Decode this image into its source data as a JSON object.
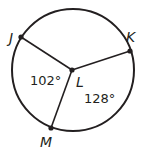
{
  "diagram": {
    "type": "circle-with-central-angles",
    "colors": {
      "stroke": "#231f20",
      "background": "#ffffff"
    },
    "circle": {
      "cx": 73,
      "cy": 70,
      "r": 61
    },
    "center": {
      "label": "L",
      "x": 72,
      "y": 70
    },
    "points": [
      {
        "label": "J",
        "x": 21,
        "y": 37
      },
      {
        "label": "K",
        "x": 130,
        "y": 51
      },
      {
        "label": "M",
        "x": 51,
        "y": 128
      }
    ],
    "angles": [
      {
        "text": "102°",
        "between": [
          "J",
          "M"
        ]
      },
      {
        "text": "128°",
        "between": [
          "K",
          "M"
        ]
      }
    ]
  }
}
